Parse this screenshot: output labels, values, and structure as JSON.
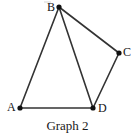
{
  "figure": {
    "caption": "Graph 2",
    "background_color": "#ffffff",
    "edge_color": "#333333",
    "vertex_color": "#111111",
    "label_color": "#141414",
    "edge_width": 1.6,
    "vertex_radius": 2.6,
    "canvas": {
      "width": 135,
      "height": 136
    }
  },
  "graph": {
    "vertices": [
      {
        "id": "A",
        "label": "A",
        "x": 20,
        "y": 108,
        "label_x": 7,
        "label_y": 101
      },
      {
        "id": "B",
        "label": "B",
        "x": 59,
        "y": 7,
        "label_x": 47,
        "label_y": 1
      },
      {
        "id": "C",
        "label": "C",
        "x": 119,
        "y": 53,
        "label_x": 123,
        "label_y": 46
      },
      {
        "id": "D",
        "label": "D",
        "x": 93,
        "y": 108,
        "label_x": 98,
        "label_y": 102
      }
    ],
    "edges": [
      {
        "from": "A",
        "to": "B",
        "x1": 20,
        "y1": 108,
        "x2": 59,
        "y2": 7
      },
      {
        "from": "A",
        "to": "D",
        "x1": 20,
        "y1": 108,
        "x2": 93,
        "y2": 108
      },
      {
        "from": "B",
        "to": "C",
        "x1": 59,
        "y1": 7,
        "x2": 119,
        "y2": 53
      },
      {
        "from": "B",
        "to": "D",
        "x1": 59,
        "y1": 7,
        "x2": 93,
        "y2": 108
      },
      {
        "from": "C",
        "to": "D",
        "x1": 119,
        "y1": 53,
        "x2": 93,
        "y2": 108
      }
    ],
    "vertex_count": 4,
    "edge_count": 5
  }
}
